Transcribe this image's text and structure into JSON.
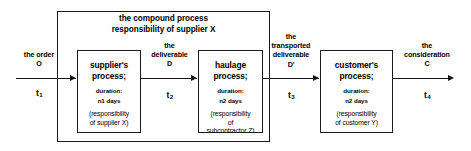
{
  "diagram": {
    "type": "process-flow",
    "compound": {
      "line1": "the compound process",
      "line2": "responsibility of supplier X"
    },
    "processes": [
      {
        "id": "supplier",
        "name_line1": "supplier's",
        "name_line2": "process;",
        "duration_label": "duration:",
        "duration_value": "n1 days",
        "resp_line1": "(responsibility",
        "resp_line2": "of supplier X)",
        "resp_line3": ""
      },
      {
        "id": "haulage",
        "name_line1": "haulage",
        "name_line2": "process;",
        "duration_label": "duration:",
        "duration_value": "n2 days",
        "resp_line1": "(responsibility",
        "resp_line2": "of",
        "resp_line3": "subcontractor Z)"
      },
      {
        "id": "customer",
        "name_line1": "customer's",
        "name_line2": "process;",
        "duration_label": "duration:",
        "duration_value": "n2 days",
        "resp_line1": "(responsibility",
        "resp_line2": "of customer Y)",
        "resp_line3": ""
      }
    ],
    "flows": [
      {
        "id": "order",
        "label_line1": "the order",
        "label_line2": "O",
        "label_line3": "",
        "label_line4": "",
        "time": "t",
        "time_sub": "1"
      },
      {
        "id": "deliverable",
        "label_line1": "the",
        "label_line2": "deliverable",
        "label_line3": "D",
        "label_line4": "",
        "time": "t",
        "time_sub": "2"
      },
      {
        "id": "transported-deliverable",
        "label_line1": "the",
        "label_line2": "transported",
        "label_line3": "deliverable",
        "label_line4": "D'",
        "time": "t",
        "time_sub": "3"
      },
      {
        "id": "consideration",
        "label_line1": "the",
        "label_line2": "consideration",
        "label_line3": "C",
        "label_line4": "",
        "time": "t",
        "time_sub": "4"
      }
    ],
    "colors": {
      "stroke": "#1a1a1a",
      "background": "#ffffff",
      "text": "#000000"
    }
  }
}
